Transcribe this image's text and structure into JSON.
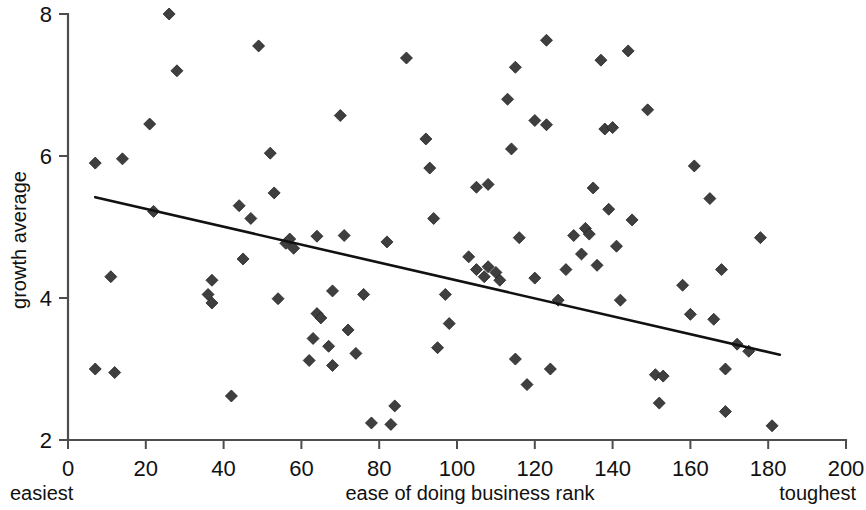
{
  "chart_data": {
    "type": "scatter",
    "title": "",
    "xlabel": "ease of doing business rank",
    "ylabel": "growth average",
    "xlim": [
      0,
      200
    ],
    "ylim": [
      2,
      8
    ],
    "xticks": [
      0,
      20,
      40,
      60,
      80,
      100,
      120,
      140,
      160,
      180,
      200
    ],
    "yticks": [
      2,
      4,
      6,
      8
    ],
    "xtick_labels": [
      "0",
      "20",
      "40",
      "60",
      "80",
      "100",
      "120",
      "140",
      "160",
      "180",
      "200"
    ],
    "ytick_labels": [
      "2",
      "4",
      "6",
      "8"
    ],
    "grid": false,
    "legend": null,
    "annotations": [
      {
        "text": "easiest",
        "position": "below-axis-left"
      },
      {
        "text": "toughest",
        "position": "below-axis-right"
      }
    ],
    "marker": {
      "shape": "diamond",
      "color": "#3f3f3f",
      "size": 11
    },
    "trendline": {
      "type": "linear",
      "color": "#111111",
      "x_start": 7,
      "y_start": 5.42,
      "x_end": 183,
      "y_end": 3.2
    },
    "points": [
      {
        "x": 7,
        "y": 5.9
      },
      {
        "x": 7,
        "y": 3.0
      },
      {
        "x": 11,
        "y": 4.3
      },
      {
        "x": 12,
        "y": 2.95
      },
      {
        "x": 14,
        "y": 5.96
      },
      {
        "x": 21,
        "y": 6.45
      },
      {
        "x": 22,
        "y": 5.22
      },
      {
        "x": 26,
        "y": 8.0
      },
      {
        "x": 28,
        "y": 7.2
      },
      {
        "x": 36,
        "y": 4.05
      },
      {
        "x": 37,
        "y": 4.25
      },
      {
        "x": 37,
        "y": 3.93
      },
      {
        "x": 42,
        "y": 2.62
      },
      {
        "x": 44,
        "y": 5.3
      },
      {
        "x": 45,
        "y": 4.55
      },
      {
        "x": 47,
        "y": 5.12
      },
      {
        "x": 49,
        "y": 7.55
      },
      {
        "x": 52,
        "y": 6.04
      },
      {
        "x": 53,
        "y": 5.48
      },
      {
        "x": 54,
        "y": 3.99
      },
      {
        "x": 56,
        "y": 4.77
      },
      {
        "x": 57,
        "y": 4.83
      },
      {
        "x": 58,
        "y": 4.7
      },
      {
        "x": 62,
        "y": 3.12
      },
      {
        "x": 63,
        "y": 3.43
      },
      {
        "x": 64,
        "y": 4.87
      },
      {
        "x": 64,
        "y": 3.78
      },
      {
        "x": 65,
        "y": 3.72
      },
      {
        "x": 67,
        "y": 3.32
      },
      {
        "x": 68,
        "y": 4.1
      },
      {
        "x": 68,
        "y": 3.05
      },
      {
        "x": 70,
        "y": 6.57
      },
      {
        "x": 71,
        "y": 4.88
      },
      {
        "x": 72,
        "y": 3.55
      },
      {
        "x": 74,
        "y": 3.22
      },
      {
        "x": 76,
        "y": 4.05
      },
      {
        "x": 78,
        "y": 2.24
      },
      {
        "x": 82,
        "y": 4.79
      },
      {
        "x": 83,
        "y": 2.22
      },
      {
        "x": 84,
        "y": 2.48
      },
      {
        "x": 87,
        "y": 7.38
      },
      {
        "x": 92,
        "y": 6.24
      },
      {
        "x": 93,
        "y": 5.83
      },
      {
        "x": 94,
        "y": 5.12
      },
      {
        "x": 95,
        "y": 3.3
      },
      {
        "x": 97,
        "y": 4.05
      },
      {
        "x": 98,
        "y": 3.64
      },
      {
        "x": 103,
        "y": 4.58
      },
      {
        "x": 105,
        "y": 5.56
      },
      {
        "x": 105,
        "y": 4.4
      },
      {
        "x": 107,
        "y": 4.3
      },
      {
        "x": 108,
        "y": 5.6
      },
      {
        "x": 108,
        "y": 4.44
      },
      {
        "x": 110,
        "y": 4.36
      },
      {
        "x": 111,
        "y": 4.25
      },
      {
        "x": 113,
        "y": 6.8
      },
      {
        "x": 114,
        "y": 6.1
      },
      {
        "x": 115,
        "y": 7.25
      },
      {
        "x": 115,
        "y": 3.14
      },
      {
        "x": 116,
        "y": 4.85
      },
      {
        "x": 118,
        "y": 2.78
      },
      {
        "x": 120,
        "y": 6.5
      },
      {
        "x": 120,
        "y": 4.28
      },
      {
        "x": 123,
        "y": 7.63
      },
      {
        "x": 123,
        "y": 6.44
      },
      {
        "x": 124,
        "y": 3.0
      },
      {
        "x": 126,
        "y": 3.97
      },
      {
        "x": 128,
        "y": 4.4
      },
      {
        "x": 130,
        "y": 4.88
      },
      {
        "x": 132,
        "y": 4.62
      },
      {
        "x": 133,
        "y": 4.98
      },
      {
        "x": 134,
        "y": 4.9
      },
      {
        "x": 135,
        "y": 5.55
      },
      {
        "x": 136,
        "y": 4.46
      },
      {
        "x": 137,
        "y": 7.35
      },
      {
        "x": 138,
        "y": 6.38
      },
      {
        "x": 139,
        "y": 5.25
      },
      {
        "x": 140,
        "y": 6.4
      },
      {
        "x": 141,
        "y": 4.73
      },
      {
        "x": 142,
        "y": 3.97
      },
      {
        "x": 144,
        "y": 7.48
      },
      {
        "x": 145,
        "y": 5.1
      },
      {
        "x": 149,
        "y": 6.65
      },
      {
        "x": 151,
        "y": 2.92
      },
      {
        "x": 152,
        "y": 2.52
      },
      {
        "x": 153,
        "y": 2.9
      },
      {
        "x": 158,
        "y": 4.18
      },
      {
        "x": 160,
        "y": 3.77
      },
      {
        "x": 161,
        "y": 5.86
      },
      {
        "x": 165,
        "y": 5.4
      },
      {
        "x": 166,
        "y": 3.7
      },
      {
        "x": 168,
        "y": 4.4
      },
      {
        "x": 169,
        "y": 3.0
      },
      {
        "x": 169,
        "y": 2.4
      },
      {
        "x": 172,
        "y": 3.35
      },
      {
        "x": 175,
        "y": 3.25
      },
      {
        "x": 178,
        "y": 4.85
      },
      {
        "x": 181,
        "y": 2.2
      }
    ]
  },
  "axes": {
    "y_title": "growth average",
    "x_title": "ease of doing business rank",
    "left_note": "easiest",
    "right_note": "toughest"
  }
}
